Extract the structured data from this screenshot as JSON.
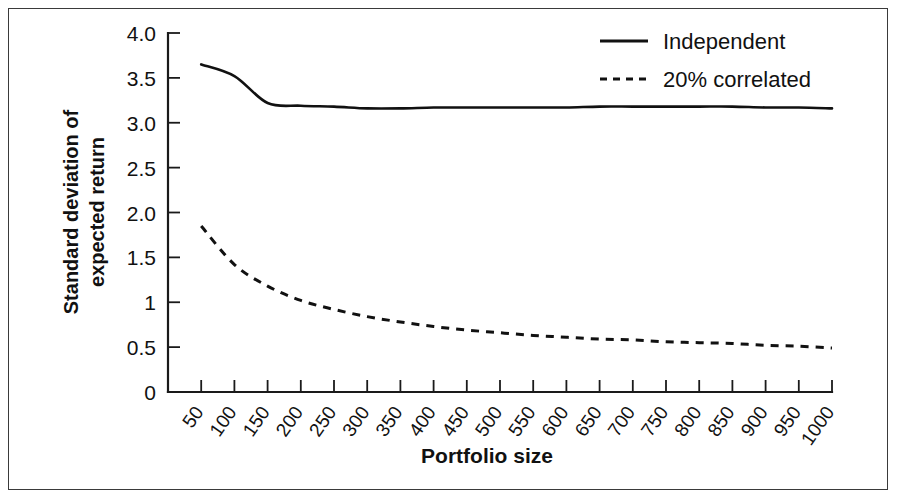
{
  "chart_data": {
    "type": "line",
    "title": "",
    "xlabel": "Portfolio size",
    "ylabel": "Standard deviation of expected return",
    "ylabel_line1": "Standard deviation of",
    "ylabel_line2": "expected return",
    "xlim": [
      0,
      1000
    ],
    "ylim": [
      0,
      4.0
    ],
    "grid": false,
    "legend_position": "top-right",
    "ytick_labels": [
      "4.0",
      "3.5",
      "3.0",
      "2.5",
      "2.0",
      "1.5",
      "1",
      "0.5",
      "0"
    ],
    "ytick_values": [
      4.0,
      3.5,
      3.0,
      2.5,
      2.0,
      1.5,
      1.0,
      0.5,
      0
    ],
    "xtick_labels": [
      "50",
      "100",
      "150",
      "200",
      "250",
      "300",
      "350",
      "400",
      "450",
      "500",
      "550",
      "600",
      "650",
      "700",
      "750",
      "800",
      "850",
      "900",
      "950",
      "1000"
    ],
    "x": [
      50,
      100,
      150,
      200,
      250,
      300,
      350,
      400,
      450,
      500,
      550,
      600,
      650,
      700,
      750,
      800,
      850,
      900,
      950,
      1000
    ],
    "series": [
      {
        "name": "Independent",
        "style": "solid",
        "color": "#111111",
        "values": [
          3.65,
          3.52,
          3.22,
          3.19,
          3.18,
          3.16,
          3.16,
          3.17,
          3.17,
          3.17,
          3.17,
          3.17,
          3.18,
          3.18,
          3.18,
          3.18,
          3.18,
          3.17,
          3.17,
          3.16
        ]
      },
      {
        "name": "20% correlated",
        "style": "dashed",
        "color": "#111111",
        "values": [
          1.85,
          1.42,
          1.18,
          1.02,
          0.92,
          0.84,
          0.78,
          0.73,
          0.69,
          0.66,
          0.63,
          0.61,
          0.59,
          0.58,
          0.56,
          0.55,
          0.54,
          0.52,
          0.51,
          0.49
        ]
      }
    ],
    "legend": [
      {
        "label": "Independent",
        "style": "solid"
      },
      {
        "label": "20% correlated",
        "style": "dashed"
      }
    ]
  },
  "colors": {
    "ink": "#111111",
    "frame": "#3a3a3a",
    "background": "#ffffff"
  }
}
